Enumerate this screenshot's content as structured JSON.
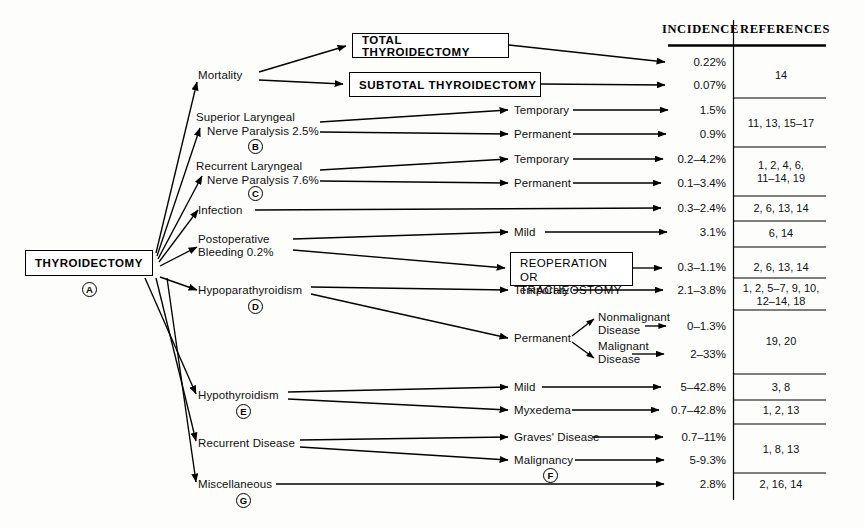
{
  "figure": {
    "type": "flowchart",
    "background_color": "#fdfdfc",
    "line_color": "#000000"
  },
  "root": {
    "label": "THYROIDECTOMY",
    "marker": "A"
  },
  "columns": {
    "incidence_header": "INCIDENCE",
    "references_header": "REFERENCES"
  },
  "branches": [
    {
      "id": "mortality",
      "label": "Mortality",
      "marker": ""
    },
    {
      "id": "superior-laryngeal",
      "label_line1": "Superior Laryngeal",
      "label_line2": "Nerve Paralysis 2.5%",
      "marker": "B"
    },
    {
      "id": "recurrent-laryngeal",
      "label_line1": "Recurrent Laryngeal",
      "label_line2": "Nerve Paralysis 7.6%",
      "marker": "C"
    },
    {
      "id": "infection",
      "label": "Infection",
      "marker": ""
    },
    {
      "id": "postoperative-bleeding",
      "label_line1": "Postoperative",
      "label_line2": "Bleeding 0.2%",
      "marker": ""
    },
    {
      "id": "hypoparathyroidism",
      "label": "Hypoparathyroidism",
      "marker": "D"
    },
    {
      "id": "hypothyroidism",
      "label": "Hypothyroidism",
      "marker": "E"
    },
    {
      "id": "recurrent-disease",
      "label": "Recurrent Disease",
      "marker": ""
    },
    {
      "id": "miscellaneous",
      "label": "Miscellaneous",
      "marker": "G"
    }
  ],
  "boxes": {
    "total_thyroidectomy": "TOTAL THYROIDECTOMY",
    "subtotal_thyroidectomy": "SUBTOTAL THYROIDECTOMY",
    "reoperation_line1": "REOPERATION",
    "reoperation_line2": "OR TRACHEOSTOMY"
  },
  "sub_labels": {
    "temporary_sln": "Temporary",
    "permanent_sln": "Permanent",
    "temporary_rln": "Temporary",
    "permanent_rln": "Permanent",
    "mild_bleeding": "Mild",
    "temporary_hypopara": "Temporary",
    "permanent_hypopara": "Permanent",
    "nonmalignant_line1": "Nonmalignant",
    "nonmalignant_line2": "Disease",
    "malignant_line1": "Malignant",
    "malignant_line2": "Disease",
    "mild_hypothyroid": "Mild",
    "myxedema": "Myxedema",
    "graves_disease": "Graves' Disease",
    "malignancy": "Malignancy",
    "malignancy_marker": "F"
  },
  "rows": [
    {
      "id": "total-thyroidectomy",
      "incidence": "0.22%",
      "y": 63
    },
    {
      "id": "subtotal-thyroidectomy",
      "incidence": "0.07%",
      "y": 86
    },
    {
      "id": "sln-temporary",
      "incidence": "1.5%",
      "y": 111
    },
    {
      "id": "sln-permanent",
      "incidence": "0.9%",
      "y": 135
    },
    {
      "id": "rln-temporary",
      "incidence": "0.2–4.2%",
      "y": 160
    },
    {
      "id": "rln-permanent",
      "incidence": "0.1–3.4%",
      "y": 184
    },
    {
      "id": "infection",
      "incidence": "0.3–2.4%",
      "y": 209
    },
    {
      "id": "bleeding-mild",
      "incidence": "3.1%",
      "y": 233
    },
    {
      "id": "bleeding-reoperation",
      "incidence": "0.3–1.1%",
      "y": 268
    },
    {
      "id": "hypopara-temporary",
      "incidence": "2.1–3.8%",
      "y": 291
    },
    {
      "id": "hypopara-nonmalignant",
      "incidence": "0–1.3%",
      "y": 327
    },
    {
      "id": "hypopara-malignant",
      "incidence": "2–33%",
      "y": 355
    },
    {
      "id": "hypothyroid-mild",
      "incidence": "5–42.8%",
      "y": 388
    },
    {
      "id": "hypothyroid-myxedema",
      "incidence": "0.7–42.8%",
      "y": 411
    },
    {
      "id": "graves-disease",
      "incidence": "0.7–11%",
      "y": 438
    },
    {
      "id": "malignancy",
      "incidence": "5-9.3%",
      "y": 461
    },
    {
      "id": "miscellaneous",
      "incidence": "2.8%",
      "y": 485
    }
  ],
  "reference_groups": [
    {
      "id": "mortality-refs",
      "text": "14",
      "y": 75,
      "divider_y": 98
    },
    {
      "id": "sln-refs",
      "text": "11, 13, 15–17",
      "y": 123,
      "divider_y": 147
    },
    {
      "id": "rln-refs",
      "text": "1, 2, 4, 6,\n11–14, 19",
      "y": 165,
      "divider_y": 196
    },
    {
      "id": "infection-refs",
      "text": "2, 6, 13, 14",
      "y": 209,
      "divider_y": 221
    },
    {
      "id": "bleeding-mild-refs",
      "text": "6, 14",
      "y": 233,
      "divider_y": 247
    },
    {
      "id": "reoperation-refs",
      "text": "2, 6, 13, 14",
      "y": 268,
      "divider_y": 278
    },
    {
      "id": "hypopara-temp-refs",
      "text": "1, 2, 5–7, 9, 10,\n12–14, 18",
      "y": 284,
      "divider_y": 310
    },
    {
      "id": "hypopara-perm-refs",
      "text": "19, 20",
      "y": 341,
      "divider_y": 374
    },
    {
      "id": "hypothyroid-mild-refs",
      "text": "3, 8",
      "y": 388,
      "divider_y": 400
    },
    {
      "id": "myxedema-refs",
      "text": "1, 2, 13",
      "y": 411,
      "divider_y": 424
    },
    {
      "id": "recurrent-disease-refs",
      "text": "1, 8, 13",
      "y": 449,
      "divider_y": 473
    },
    {
      "id": "misc-refs",
      "text": "2, 16, 14",
      "y": 485,
      "divider_y": 0
    }
  ]
}
